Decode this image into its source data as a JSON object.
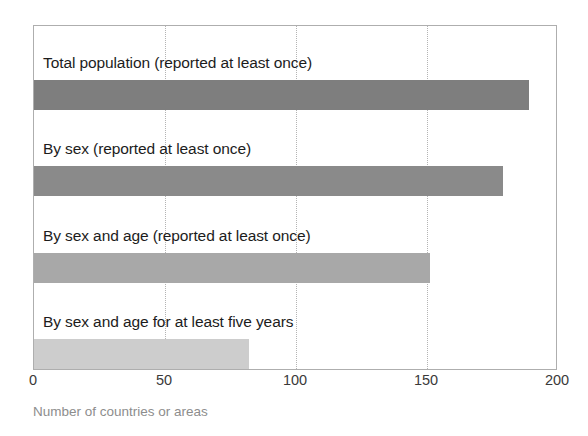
{
  "chart_data": {
    "type": "bar",
    "orientation": "horizontal",
    "title": "",
    "xlabel": "Number of countries or areas",
    "ylabel": "",
    "xlim": [
      0,
      200
    ],
    "xticks": [
      "0",
      "50",
      "100",
      "150",
      "200"
    ],
    "xtick_values": [
      0,
      50,
      100,
      150,
      200
    ],
    "grid": "vertical-dotted",
    "legend": "none",
    "categories": [
      "Total population (reported at least once)",
      "By sex (reported at least once)",
      "By sex and age (reported at least once)",
      "By sex and age for at least five years"
    ],
    "values": [
      189,
      179,
      151,
      82
    ],
    "bar_colors": [
      "#7e7e7e",
      "#8a8a8a",
      "#a8a8a8",
      "#cdcdcd"
    ]
  },
  "axis": {
    "caption": "Number of countries or areas"
  },
  "colors": {
    "frame": "#aeaeae",
    "gridline": "#b4b4b4",
    "label_text": "#1c1c1c",
    "tick_text": "#3a3a3a",
    "caption_text": "#8d8d8d",
    "background": "#ffffff"
  }
}
